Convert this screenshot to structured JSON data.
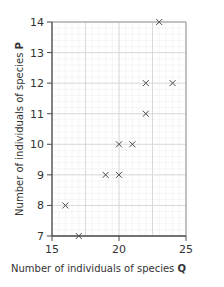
{
  "chart_data": {
    "type": "scatter",
    "title": "",
    "xlabel": "Number of individuals of species",
    "xlabel_species": "Q",
    "ylabel": "Number of individuals of species",
    "ylabel_species": "P",
    "xlim": [
      15,
      25
    ],
    "ylim": [
      7,
      14
    ],
    "x_ticks": [
      15,
      20,
      25
    ],
    "y_ticks": [
      7,
      8,
      9,
      10,
      11,
      12,
      13,
      14
    ],
    "grid": true,
    "marker": "x",
    "points": [
      {
        "x": 16,
        "y": 8
      },
      {
        "x": 17,
        "y": 7
      },
      {
        "x": 19,
        "y": 9
      },
      {
        "x": 20,
        "y": 9
      },
      {
        "x": 20,
        "y": 10
      },
      {
        "x": 21,
        "y": 10
      },
      {
        "x": 22,
        "y": 11
      },
      {
        "x": 22,
        "y": 12
      },
      {
        "x": 24,
        "y": 12
      },
      {
        "x": 23,
        "y": 14
      }
    ]
  },
  "colors": {
    "axis": "#4a4a4a",
    "grid_major": "#d6d6d6",
    "grid_minor": "#eeeeee",
    "marker": "#4a4a4a",
    "text": "#333333"
  }
}
